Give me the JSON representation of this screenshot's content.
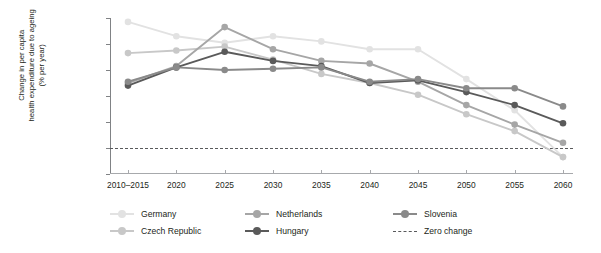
{
  "chart_data": {
    "type": "line",
    "title": "",
    "xlabel": "",
    "ylabel": "Change in per capita health expenditure due to ageing (% per year)",
    "ylabel_lines": [
      "Change in per capita",
      "health expenditure due to ageing",
      "(% per year)"
    ],
    "categories": [
      "2010–2015",
      "2020",
      "2025",
      "2030",
      "2035",
      "2040",
      "2045",
      "2050",
      "2055",
      "2060"
    ],
    "x_tick_labels": [
      "2010–2015",
      "2020",
      "2025",
      "2030",
      "2035",
      "2040",
      "2045",
      "2050",
      "2055",
      "2060"
    ],
    "y_tick_labels": [
      "1.0",
      "0.8",
      "0.6",
      "0.4",
      "0.2",
      "0",
      "-0.2"
    ],
    "y_tick_values": [
      1.0,
      0.8,
      0.6,
      0.4,
      0.2,
      0,
      -0.2
    ],
    "ylim": [
      -0.2,
      1.0
    ],
    "grid": false,
    "legend_position": "bottom-left",
    "series": [
      {
        "name": "Germany",
        "color": "#e2e2e2",
        "values": [
          0.97,
          0.86,
          0.81,
          0.86,
          0.82,
          0.76,
          0.76,
          0.53,
          0.29,
          -0.07
        ]
      },
      {
        "name": "Czech Republic",
        "color": "#c8c8c8",
        "values": [
          0.73,
          0.75,
          0.78,
          0.68,
          0.57,
          0.5,
          0.41,
          0.26,
          0.13,
          -0.07
        ]
      },
      {
        "name": "Netherlands",
        "color": "#a6a6a6",
        "values": [
          0.5,
          0.63,
          0.93,
          0.76,
          0.67,
          0.65,
          0.51,
          0.33,
          0.18,
          0.04
        ]
      },
      {
        "name": "Hungary",
        "color": "#5a5a5a",
        "values": [
          0.48,
          0.62,
          0.74,
          0.67,
          0.63,
          0.5,
          0.52,
          0.43,
          0.33,
          0.19
        ]
      },
      {
        "name": "Slovenia",
        "color": "#8a8a8a",
        "values": [
          0.51,
          0.62,
          0.6,
          0.61,
          0.62,
          0.51,
          0.53,
          0.46,
          0.46,
          0.32
        ]
      }
    ],
    "reference_line": {
      "name": "Zero change",
      "value": 0,
      "style": "dashed",
      "color": "#58595b"
    }
  },
  "legend": {
    "items": [
      {
        "label": "Germany",
        "color": "#e2e2e2",
        "style": "solid",
        "marker": true
      },
      {
        "label": "Netherlands",
        "color": "#a6a6a6",
        "style": "solid",
        "marker": true
      },
      {
        "label": "Slovenia",
        "color": "#8a8a8a",
        "style": "solid",
        "marker": true
      },
      {
        "label": "Czech Republic",
        "color": "#c8c8c8",
        "style": "solid",
        "marker": true
      },
      {
        "label": "Hungary",
        "color": "#5a5a5a",
        "style": "solid",
        "marker": true
      },
      {
        "label": "Zero change",
        "color": "#58595b",
        "style": "dashed",
        "marker": false
      }
    ]
  }
}
